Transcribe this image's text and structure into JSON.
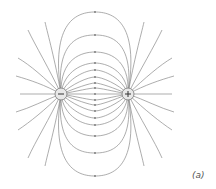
{
  "figure": {
    "label": "(a)",
    "charges": [
      {
        "sign": "−",
        "type": "negative",
        "x": 61,
        "y": 94
      },
      {
        "sign": "+",
        "type": "positive",
        "x": 128,
        "y": 94
      }
    ],
    "colors": {
      "line": "#8a8a8a",
      "charge_fill": "#e8e8e8",
      "charge_stroke": "#777777",
      "sign": "#333333"
    }
  }
}
